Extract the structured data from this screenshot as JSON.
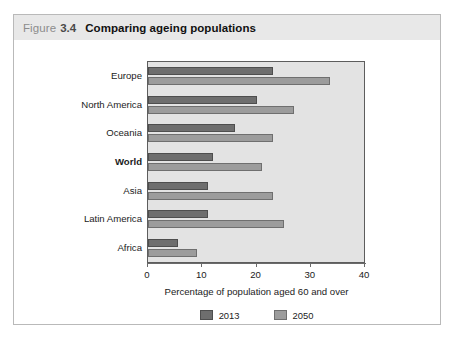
{
  "figure": {
    "label_word": "Figure",
    "number": "3.4",
    "title": "Comparing ageing populations"
  },
  "legend": {
    "items": [
      {
        "label": "2013",
        "color": "#6e6e6e"
      },
      {
        "label": "2050",
        "color": "#9c9c9c"
      }
    ]
  },
  "axis": {
    "x_title": "Percentage of population aged 60 and over",
    "ticks": [
      "0",
      "10",
      "20",
      "30",
      "40"
    ]
  },
  "chart_data": {
    "type": "bar",
    "orientation": "horizontal",
    "title": "Comparing ageing populations",
    "xlabel": "Percentage of population aged 60 and over",
    "ylabel": "",
    "xlim": [
      0,
      40
    ],
    "xticks": [
      0,
      10,
      20,
      30,
      40
    ],
    "grid": false,
    "legend_position": "bottom",
    "categories": [
      "Europe",
      "North America",
      "Oceania",
      "World",
      "Asia",
      "Latin America",
      "Africa"
    ],
    "highlighted_category": "World",
    "series": [
      {
        "name": "2013",
        "color": "#6e6e6e",
        "values": [
          23,
          20,
          16,
          12,
          11,
          11,
          5.5
        ]
      },
      {
        "name": "2050",
        "color": "#9c9c9c",
        "values": [
          33.5,
          27,
          23,
          21,
          23,
          25,
          9
        ]
      }
    ]
  }
}
